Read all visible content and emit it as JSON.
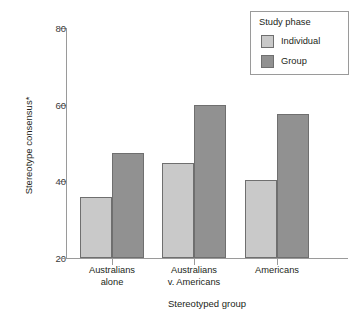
{
  "chart_data": {
    "type": "bar",
    "title": "",
    "xlabel": "Stereotyped group",
    "ylabel": "Stereotype consensus*",
    "categories": [
      "Australians alone",
      "Australians v. Americans",
      "Americans"
    ],
    "category_lines": [
      [
        "Australians",
        "alone"
      ],
      [
        "Australians",
        "v. Americans"
      ],
      [
        "Americans",
        ""
      ]
    ],
    "series": [
      {
        "name": "Individual",
        "color": "#c9c9c9",
        "values": [
          36.0,
          44.8,
          40.4
        ]
      },
      {
        "name": "Group",
        "color": "#919191",
        "values": [
          47.5,
          59.9,
          57.5
        ]
      }
    ],
    "ylim": [
      20,
      80
    ],
    "yticks": [
      20,
      40,
      60,
      80
    ],
    "ytick_labels": [
      "20",
      "40",
      "60",
      "80"
    ],
    "grid": false,
    "legend_position": "top-right",
    "legend_title": "Study phase"
  },
  "legend": {
    "title": "Study phase",
    "entries": [
      {
        "label": "Individual",
        "color": "#c9c9c9"
      },
      {
        "label": "Group",
        "color": "#919191"
      }
    ]
  },
  "axes": {
    "x_title": "Stereotyped group",
    "y_title": "Stereotype consensus*",
    "y_ticks": [
      "80",
      "60",
      "40",
      "20"
    ]
  }
}
